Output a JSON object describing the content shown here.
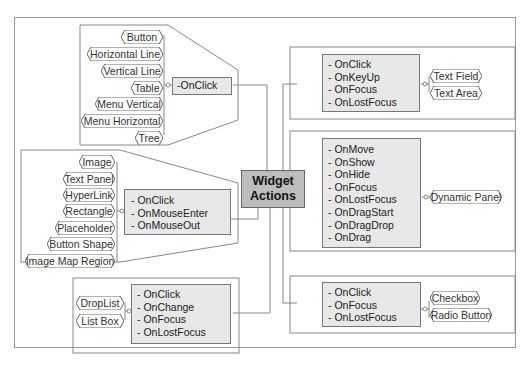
{
  "center": {
    "line1": "Widget",
    "line2": "Actions"
  },
  "groups": {
    "basic": {
      "widgets": [
        "Button",
        "Horizontal Line",
        "Vertical Line",
        "Table",
        "Menu Vertical",
        "Menu Horizontal",
        "Tree"
      ],
      "events": [
        "-OnClick"
      ]
    },
    "shapes": {
      "widgets": [
        "Image",
        "Text Panel",
        "HyperLink",
        "Rectangle",
        "Placeholder",
        "Button Shape",
        "Image Map Region"
      ],
      "events": [
        "- OnClick",
        "- OnMouseEnter",
        "- OnMouseOut"
      ]
    },
    "lists": {
      "widgets": [
        "DropList",
        "List Box"
      ],
      "events": [
        "- OnClick",
        "- OnChange",
        "- OnFocus",
        "- OnLostFocus"
      ]
    },
    "text": {
      "widgets": [
        "Text Field",
        "Text Area"
      ],
      "events": [
        "- OnClick",
        "- OnKeyUp",
        "- OnFocus",
        "- OnLostFocus"
      ]
    },
    "panel": {
      "widgets": [
        "Dynamic Panel"
      ],
      "events": [
        "- OnMove",
        "- OnShow",
        "- OnHide",
        "- OnFocus",
        "- OnLostFocus",
        "- OnDragStart",
        "- OnDragDrop",
        "- OnDrag"
      ]
    },
    "toggles": {
      "widgets": [
        "Checkbox",
        "Radio Button"
      ],
      "events": [
        "- OnClick",
        "- OnFocus",
        "- OnLostFocus"
      ]
    }
  },
  "colors": {
    "event_fill": "#e8e8e8",
    "center_fill": "#bdbdbd",
    "border": "#777777"
  }
}
